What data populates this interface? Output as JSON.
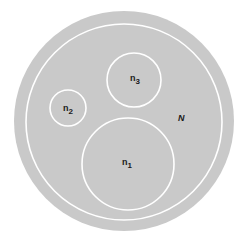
{
  "diagram": {
    "type": "venn-set-diagram",
    "colors": {
      "background": "#ffffff",
      "disc": "#c9c9c9",
      "ring": "#ffffff",
      "label": "#1a1a1a"
    },
    "universe": {
      "label": "N"
    },
    "subsets": [
      {
        "id": "n1",
        "label_base": "n",
        "label_sub": "1"
      },
      {
        "id": "n2",
        "label_base": "n",
        "label_sub": "2"
      },
      {
        "id": "n3",
        "label_base": "n",
        "label_sub": "3"
      }
    ]
  }
}
